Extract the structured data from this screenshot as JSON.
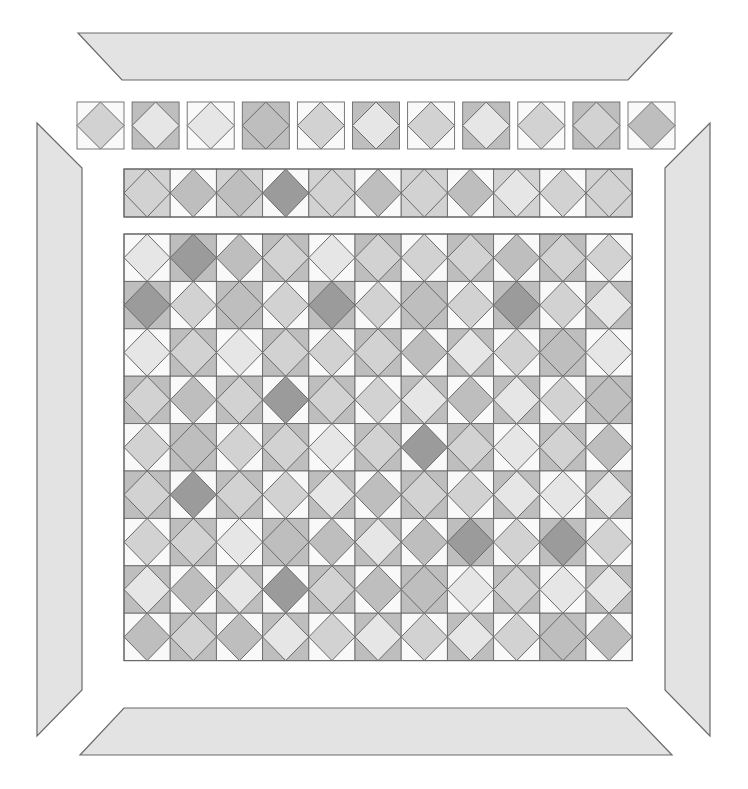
{
  "palette": {
    "W": "#f9f9f9",
    "L": "#e6e6e6",
    "M": "#d2d2d2",
    "S": "#bebebe",
    "D": "#9b9b9b",
    "border_piece": "#e3e3e3",
    "outline": "#6a6a6a"
  },
  "border_pieces": {
    "top": {
      "points": "78,33 672,33 628,80 122,80"
    },
    "bottom": {
      "points": "124,708 627,708 672,755 80,755"
    },
    "left": {
      "points": "37,123 82,168 82,690 37,736"
    },
    "right": {
      "points": "710,123 710,736 665,690 665,168"
    }
  },
  "loose_squares": {
    "y": 102,
    "size": 47,
    "x_start": 77,
    "step": 55.1,
    "cells": [
      {
        "bg": "W",
        "diamond": "M"
      },
      {
        "bg": "S",
        "diamond": "L"
      },
      {
        "bg": "W",
        "diamond": "L"
      },
      {
        "bg": "S",
        "diamond": "S"
      },
      {
        "bg": "W",
        "diamond": "M"
      },
      {
        "bg": "S",
        "diamond": "L"
      },
      {
        "bg": "W",
        "diamond": "M"
      },
      {
        "bg": "S",
        "diamond": "L"
      },
      {
        "bg": "W",
        "diamond": "M"
      },
      {
        "bg": "S",
        "diamond": "M"
      },
      {
        "bg": "W",
        "diamond": "S"
      }
    ]
  },
  "strip": {
    "x": 124,
    "y": 169,
    "cols": 11,
    "cell_w": 46.2,
    "cell_h": 48,
    "cells": [
      {
        "bg": "M",
        "diamond": "M"
      },
      {
        "bg": "W",
        "diamond": "S"
      },
      {
        "bg": "M",
        "diamond": "S"
      },
      {
        "bg": "W",
        "diamond": "D"
      },
      {
        "bg": "M",
        "diamond": "M"
      },
      {
        "bg": "W",
        "diamond": "S"
      },
      {
        "bg": "M",
        "diamond": "M"
      },
      {
        "bg": "W",
        "diamond": "S"
      },
      {
        "bg": "M",
        "diamond": "L"
      },
      {
        "bg": "W",
        "diamond": "M"
      },
      {
        "bg": "M",
        "diamond": "M"
      }
    ]
  },
  "grid": {
    "x": 124,
    "y": 234,
    "cols": 11,
    "rows": 9,
    "cell_w": 46.2,
    "cell_h": 47.4,
    "rows_data": [
      [
        [
          "W",
          "L"
        ],
        [
          "S",
          "D"
        ],
        [
          "W",
          "S"
        ],
        [
          "S",
          "M"
        ],
        [
          "W",
          "L"
        ],
        [
          "S",
          "M"
        ],
        [
          "W",
          "M"
        ],
        [
          "S",
          "M"
        ],
        [
          "W",
          "S"
        ],
        [
          "S",
          "M"
        ],
        [
          "W",
          "M"
        ]
      ],
      [
        [
          "S",
          "D"
        ],
        [
          "W",
          "M"
        ],
        [
          "S",
          "S"
        ],
        [
          "W",
          "M"
        ],
        [
          "S",
          "D"
        ],
        [
          "W",
          "M"
        ],
        [
          "S",
          "S"
        ],
        [
          "W",
          "M"
        ],
        [
          "S",
          "D"
        ],
        [
          "W",
          "M"
        ],
        [
          "S",
          "L"
        ]
      ],
      [
        [
          "W",
          "L"
        ],
        [
          "S",
          "M"
        ],
        [
          "W",
          "L"
        ],
        [
          "S",
          "M"
        ],
        [
          "W",
          "M"
        ],
        [
          "S",
          "M"
        ],
        [
          "W",
          "S"
        ],
        [
          "S",
          "L"
        ],
        [
          "W",
          "M"
        ],
        [
          "S",
          "S"
        ],
        [
          "W",
          "L"
        ]
      ],
      [
        [
          "S",
          "M"
        ],
        [
          "W",
          "S"
        ],
        [
          "S",
          "M"
        ],
        [
          "W",
          "D"
        ],
        [
          "S",
          "M"
        ],
        [
          "W",
          "M"
        ],
        [
          "S",
          "L"
        ],
        [
          "W",
          "S"
        ],
        [
          "S",
          "L"
        ],
        [
          "W",
          "M"
        ],
        [
          "S",
          "S"
        ]
      ],
      [
        [
          "W",
          "M"
        ],
        [
          "S",
          "S"
        ],
        [
          "W",
          "M"
        ],
        [
          "S",
          "M"
        ],
        [
          "W",
          "L"
        ],
        [
          "S",
          "M"
        ],
        [
          "W",
          "D"
        ],
        [
          "S",
          "M"
        ],
        [
          "W",
          "L"
        ],
        [
          "S",
          "M"
        ],
        [
          "W",
          "S"
        ]
      ],
      [
        [
          "S",
          "M"
        ],
        [
          "W",
          "D"
        ],
        [
          "S",
          "M"
        ],
        [
          "W",
          "M"
        ],
        [
          "S",
          "L"
        ],
        [
          "W",
          "S"
        ],
        [
          "S",
          "M"
        ],
        [
          "W",
          "M"
        ],
        [
          "S",
          "L"
        ],
        [
          "W",
          "L"
        ],
        [
          "S",
          "L"
        ]
      ],
      [
        [
          "W",
          "M"
        ],
        [
          "S",
          "M"
        ],
        [
          "W",
          "L"
        ],
        [
          "S",
          "S"
        ],
        [
          "W",
          "S"
        ],
        [
          "S",
          "L"
        ],
        [
          "W",
          "S"
        ],
        [
          "S",
          "D"
        ],
        [
          "W",
          "M"
        ],
        [
          "S",
          "D"
        ],
        [
          "W",
          "M"
        ]
      ],
      [
        [
          "S",
          "L"
        ],
        [
          "W",
          "S"
        ],
        [
          "S",
          "L"
        ],
        [
          "W",
          "D"
        ],
        [
          "S",
          "M"
        ],
        [
          "W",
          "S"
        ],
        [
          "S",
          "S"
        ],
        [
          "W",
          "L"
        ],
        [
          "S",
          "M"
        ],
        [
          "W",
          "L"
        ],
        [
          "S",
          "L"
        ]
      ],
      [
        [
          "W",
          "S"
        ],
        [
          "S",
          "M"
        ],
        [
          "W",
          "S"
        ],
        [
          "S",
          "L"
        ],
        [
          "W",
          "M"
        ],
        [
          "S",
          "L"
        ],
        [
          "W",
          "M"
        ],
        [
          "S",
          "L"
        ],
        [
          "W",
          "M"
        ],
        [
          "S",
          "S"
        ],
        [
          "W",
          "S"
        ]
      ]
    ]
  }
}
